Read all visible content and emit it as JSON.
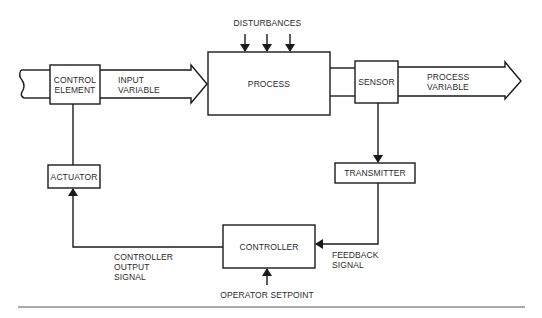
{
  "diagram": {
    "type": "process-control-loop",
    "colors": {
      "line": "#1a1a1a",
      "text": "#2a2a2a",
      "background": "#ffffff"
    },
    "blocks": {
      "control_element": {
        "line1": "CONTROL",
        "line2": "ELEMENT"
      },
      "process": {
        "label": "PROCESS"
      },
      "sensor": {
        "label": "SENSOR"
      },
      "transmitter": {
        "label": "TRANSMITTER"
      },
      "controller": {
        "label": "CONTROLLER"
      },
      "actuator": {
        "label": "ACTUATOR"
      }
    },
    "flows": {
      "input_variable": {
        "line1": "INPUT",
        "line2": "VARIABLE"
      },
      "process_variable": {
        "line1": "PROCESS",
        "line2": "VARIABLE"
      },
      "disturbances": {
        "label": "DISTURBANCES",
        "arrow_count": 3
      },
      "controller_output": {
        "line1": "CONTROLLER",
        "line2": "OUTPUT",
        "line3": "SIGNAL"
      },
      "feedback": {
        "line1": "FEEDBACK",
        "line2": "SIGNAL"
      },
      "operator_setpoint": {
        "label": "OPERATOR SETPOINT"
      }
    },
    "connections": [
      {
        "from": "control_element",
        "to": "process",
        "label": "INPUT VARIABLE"
      },
      {
        "from": "process",
        "to": "sensor"
      },
      {
        "from": "sensor",
        "to": "output",
        "label": "PROCESS VARIABLE"
      },
      {
        "from": "sensor",
        "to": "transmitter"
      },
      {
        "from": "transmitter",
        "to": "controller",
        "label": "FEEDBACK SIGNAL"
      },
      {
        "from": "controller",
        "to": "actuator",
        "label": "CONTROLLER OUTPUT SIGNAL"
      },
      {
        "from": "actuator",
        "to": "control_element"
      },
      {
        "from": "operator_setpoint",
        "to": "controller"
      },
      {
        "from": "disturbances",
        "to": "process"
      }
    ]
  }
}
